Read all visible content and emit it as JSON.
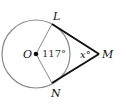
{
  "diagram": {
    "points": {
      "O": "O",
      "L": "L",
      "M": "M",
      "N": "N"
    },
    "angles": {
      "central": "117°",
      "external": "x°"
    },
    "colors": {
      "circle": "#8a8a8a",
      "tangent": "#111111",
      "radius": "#8a8a8a"
    }
  }
}
